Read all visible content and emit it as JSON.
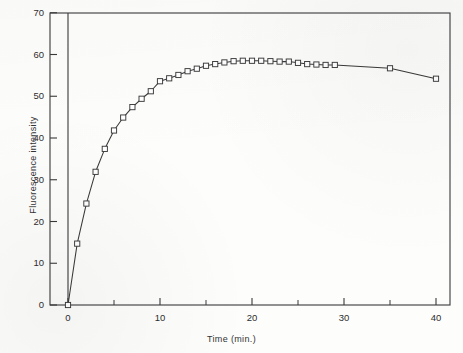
{
  "chart_data": {
    "type": "line",
    "title": "",
    "subtitle": "",
    "xlabel": "Time (min.)",
    "ylabel": "Fluorescence intensity",
    "xlim": [
      -1.2,
      42.5
    ],
    "ylim": [
      0,
      70
    ],
    "xticks": [
      0,
      10,
      20,
      30,
      40
    ],
    "xtick_labels": [
      "0",
      "10",
      "20",
      "30",
      "40"
    ],
    "xminorticks": [
      5,
      15,
      25,
      35
    ],
    "yticks": [
      0,
      10,
      20,
      30,
      40,
      50,
      60,
      70
    ],
    "ytick_labels": [
      "0",
      "10",
      "20",
      "30",
      "40",
      "50",
      "60",
      "70"
    ],
    "grid": false,
    "legend": null,
    "marker": "open-square",
    "line_color": "#3a3a3a",
    "marker_fill": "#ffffff",
    "marker_edge": "#3a3a3a",
    "series": [
      {
        "name": "Fluorescence intensity",
        "x": [
          0,
          1,
          2,
          3,
          4,
          5,
          6,
          7,
          8,
          9,
          10,
          11,
          12,
          13,
          14,
          15,
          16,
          17,
          18,
          19,
          20,
          21,
          22,
          23,
          24,
          25,
          26,
          27,
          28,
          29,
          35,
          40
        ],
        "values": [
          0,
          14.7,
          24.3,
          31.9,
          37.4,
          41.8,
          44.9,
          47.4,
          49.4,
          51.2,
          53.6,
          54.3,
          55.1,
          56.0,
          56.6,
          57.3,
          57.7,
          58.1,
          58.4,
          58.5,
          58.5,
          58.5,
          58.4,
          58.3,
          58.3,
          58.0,
          57.7,
          57.6,
          57.5,
          57.5,
          56.7,
          54.2
        ]
      }
    ]
  },
  "axes": {
    "x_title": "Time (min.)",
    "y_title": "Fluorescence intensity"
  }
}
